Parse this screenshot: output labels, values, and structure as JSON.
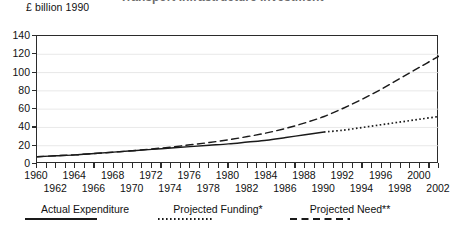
{
  "figure": {
    "title_cutoff": "Transport Infrastructure Investment",
    "y_axis_caption": "£ billion 1990"
  },
  "legend": {
    "items": [
      {
        "label": "Actual Expenditure",
        "style": "solid",
        "name": "legend-actual-expenditure"
      },
      {
        "label": "Projected Funding*",
        "style": "dotted",
        "name": "legend-projected-funding"
      },
      {
        "label": "Projected Need**",
        "style": "dashed",
        "name": "legend-projected-need"
      }
    ]
  },
  "chart_data": {
    "type": "line",
    "title": "",
    "xlabel": "",
    "ylabel": "£ billion 1990",
    "xlim": [
      1960,
      2002
    ],
    "ylim": [
      0,
      140
    ],
    "yticks": [
      0,
      20,
      40,
      60,
      80,
      100,
      120,
      140
    ],
    "xticks_labeled_top": [
      1960,
      1964,
      1968,
      1972,
      1976,
      1980,
      1984,
      1988,
      1992,
      1996,
      2000
    ],
    "xticks_labeled_bottom": [
      1962,
      1966,
      1970,
      1974,
      1978,
      1982,
      1986,
      1990,
      1994,
      1998,
      2002
    ],
    "xtick_interval": 1,
    "grid": true,
    "grid_axis": "y",
    "legend_position": "bottom",
    "series": [
      {
        "name": "Actual Expenditure",
        "style": "solid",
        "x": [
          1960,
          1962,
          1964,
          1966,
          1968,
          1970,
          1972,
          1974,
          1976,
          1978,
          1980,
          1982,
          1984,
          1986,
          1988,
          1990
        ],
        "values": [
          8,
          9,
          10,
          11.5,
          13,
          14.5,
          16,
          17.5,
          19,
          20.5,
          22,
          24,
          26,
          29,
          32,
          35
        ]
      },
      {
        "name": "Projected Funding*",
        "style": "dotted",
        "x": [
          1990,
          1992,
          1994,
          1996,
          1998,
          2000,
          2002
        ],
        "values": [
          35,
          37,
          40,
          43,
          46,
          49,
          52
        ]
      },
      {
        "name": "Projected Need**",
        "style": "dashed",
        "x": [
          1960,
          1962,
          1964,
          1966,
          1968,
          1970,
          1972,
          1974,
          1976,
          1978,
          1980,
          1982,
          1984,
          1986,
          1988,
          1990,
          1992,
          1994,
          1996,
          1998,
          2000,
          2002
        ],
        "values": [
          8,
          9,
          10,
          11.5,
          13,
          14.5,
          16.5,
          18.5,
          21,
          23.5,
          26.5,
          30,
          34,
          39,
          45,
          52,
          61,
          71,
          82,
          94,
          106,
          118
        ]
      }
    ]
  }
}
